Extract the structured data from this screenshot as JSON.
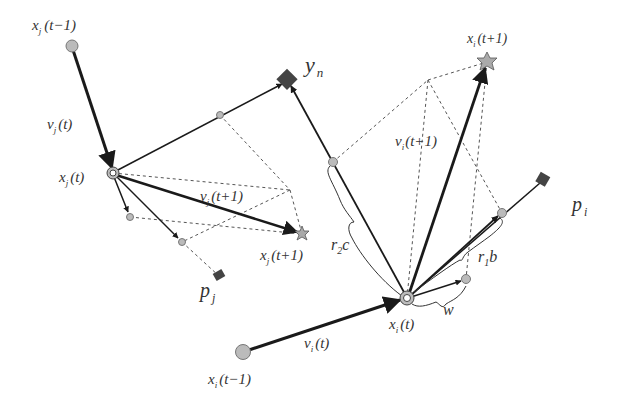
{
  "diagram": {
    "type": "particle-swarm-velocity-update",
    "labels": {
      "xj_prev": "x",
      "xj_prev_sub": "j",
      "xj_prev_arg": "(t−1)",
      "vj_t": "v",
      "vj_t_sub": "j",
      "vj_t_arg": "(t)",
      "xj_t": "x",
      "xj_t_sub": "j",
      "xj_t_arg": "(t)",
      "vj_next": "v",
      "vj_next_sub": "j",
      "vj_next_arg": "(t+1)",
      "xj_next": "x",
      "xj_next_sub": "j",
      "xj_next_arg": "(t+1)",
      "pj": "p",
      "pj_sub": "j",
      "yn": "y",
      "yn_sub": "n",
      "xi_next": "x",
      "xi_next_sub": "i",
      "xi_next_arg": "(t+1)",
      "vi_next": "v",
      "vi_next_sub": "i",
      "vi_next_arg": "(t+1)",
      "r2c": "r",
      "r2c_sub": "2",
      "r2c_tail": "c",
      "r1b": "r",
      "r1b_sub": "1",
      "r1b_tail": "b",
      "w": "w",
      "pi": "p",
      "pi_sub": "i",
      "xi_t": "x",
      "xi_t_sub": "i",
      "xi_t_arg": "(t)",
      "vi_t": "v",
      "vi_t_sub": "i",
      "vi_t_arg": "(t)",
      "xi_prev": "x",
      "xi_prev_sub": "i",
      "xi_prev_arg": "(t−1)"
    },
    "colors": {
      "line": "#1a1a1a",
      "dashed": "#555555",
      "node_fill": "#bbbbbb",
      "diamond_fill": "#444444",
      "star_fill": "#aaaaaa",
      "text": "#333333"
    }
  }
}
